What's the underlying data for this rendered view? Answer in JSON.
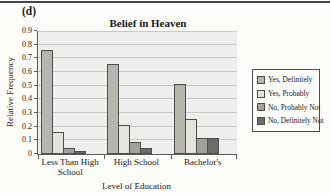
{
  "figure_label": "(d)",
  "chart_data": {
    "type": "bar",
    "title": "Belief in Heaven",
    "xlabel": "Level of Education",
    "ylabel": "Relative Frequency",
    "categories": [
      "Less Than High School",
      "High School",
      "Bachelor's"
    ],
    "series": [
      {
        "name": "Yes, Definitely",
        "color": "#b6b6ae",
        "values": [
          0.76,
          0.66,
          0.51
        ]
      },
      {
        "name": "Yes, Probably",
        "color": "#e5e4dc",
        "values": [
          0.16,
          0.21,
          0.255
        ]
      },
      {
        "name": "No, Probably Not",
        "color": "#a2a29a",
        "values": [
          0.045,
          0.085,
          0.115
        ]
      },
      {
        "name": "No, Definitely Not",
        "color": "#6b6b6b",
        "values": [
          0.02,
          0.045,
          0.12
        ]
      }
    ],
    "ylim": [
      0,
      0.9
    ],
    "y_ticks": [
      "0",
      "0.1",
      "0.2",
      "0.3",
      "0.4",
      "0.5",
      "0.6",
      "0.7",
      "0.8",
      "0.9"
    ],
    "grid": true,
    "legend_position": "right",
    "colors": {
      "plot_bg": "#eeeeec",
      "gridline": "#c8c8c6",
      "axis": "#5c5c5c",
      "bar_border": "#4d4d4d",
      "top_rule": "#474747"
    }
  }
}
